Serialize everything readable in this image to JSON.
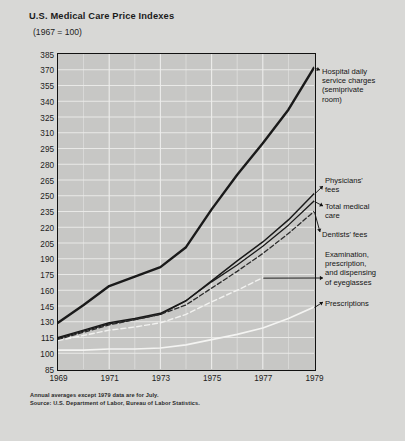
{
  "title": "U.S. Medical Care Price Indexes",
  "subtitle": "(1967 = 100)",
  "footnotes": {
    "line1": "Annual averages except 1979 data are for July.",
    "line2": "Source: U.S. Department of Labor, Bureau of Labor Statistics."
  },
  "annotations": {
    "hospital": "Hospital daily\nservice charges\n(semiprivate\nroom)",
    "physicians": "Physicians'\nfees",
    "total": "Total medical\ncare",
    "dentists": "Dentists' fees",
    "eyeglasses": "Examination,\nprescription,\nand dispensing\nof eyeglasses",
    "prescriptions": "Prescriptions"
  },
  "colors": {
    "background": "#d8d8d6",
    "plot_background": "#c7c7c5",
    "axis": "#111111",
    "dark_line": "#1a1a1a",
    "light_line": "#f2f2f0",
    "grid": "#ededeb",
    "text": "#1c1c1c"
  },
  "chart_data": {
    "type": "line",
    "title": "U.S. Medical Care Price Indexes",
    "subtitle": "(1967 = 100)",
    "xlabel": "",
    "ylabel": "",
    "xlim": [
      1969,
      1979
    ],
    "ylim": [
      85,
      385
    ],
    "ytick_step": 15,
    "grid": true,
    "legend_position": "right-annotations",
    "xticks": [
      "1969",
      "1971",
      "1973",
      "1975",
      "1977",
      "1979"
    ],
    "xtick_values": [
      1969,
      1971,
      1973,
      1975,
      1977,
      1979
    ],
    "yticks": [
      "385",
      "370",
      "355",
      "340",
      "325",
      "310",
      "295",
      "280",
      "265",
      "250",
      "235",
      "220",
      "205",
      "190",
      "175",
      "160",
      "145",
      "130",
      "115",
      "100",
      "85"
    ],
    "ytick_values": [
      385,
      370,
      355,
      340,
      325,
      310,
      295,
      280,
      265,
      250,
      235,
      220,
      205,
      190,
      175,
      160,
      145,
      130,
      115,
      100,
      85
    ],
    "x": [
      1969,
      1970,
      1971,
      1972,
      1973,
      1974,
      1975,
      1976,
      1977,
      1978,
      1979
    ],
    "series": [
      {
        "name": "Hospital daily service charges (semiprivate room)",
        "style": "solid",
        "color": "#1a1a1a",
        "width": 2.4,
        "values": [
          129,
          146,
          164,
          173,
          182,
          201,
          237,
          270,
          300,
          332,
          372
        ]
      },
      {
        "name": "Physicians' fees",
        "style": "solid",
        "color": "#1a1a1a",
        "width": 1.5,
        "values": [
          115,
          122,
          129,
          133,
          138,
          150,
          169,
          188,
          206,
          227,
          252
        ]
      },
      {
        "name": "Total medical care",
        "style": "solid",
        "color": "#1a1a1a",
        "width": 1.3,
        "values": [
          114,
          121,
          128,
          132,
          137,
          150,
          168,
          184,
          202,
          222,
          245
        ]
      },
      {
        "name": "Dentists' fees",
        "style": "dashed",
        "color": "#2b2b2b",
        "width": 1.3,
        "values": [
          113,
          120,
          127,
          132,
          137,
          146,
          162,
          178,
          195,
          214,
          235
        ]
      },
      {
        "name": "Examination, prescription, and dispensing of eyeglasses",
        "style": "dashed-light",
        "color": "#f2f2f0",
        "width": 1.4,
        "values": [
          112,
          117,
          122,
          125,
          129,
          137,
          149,
          160,
          172,
          null,
          null
        ]
      },
      {
        "name": "Prescriptions",
        "style": "solid-light",
        "color": "#f4f4f2",
        "width": 1.6,
        "values": [
          103,
          103,
          104,
          104,
          105,
          108,
          113,
          118,
          124,
          133,
          144
        ]
      }
    ]
  }
}
